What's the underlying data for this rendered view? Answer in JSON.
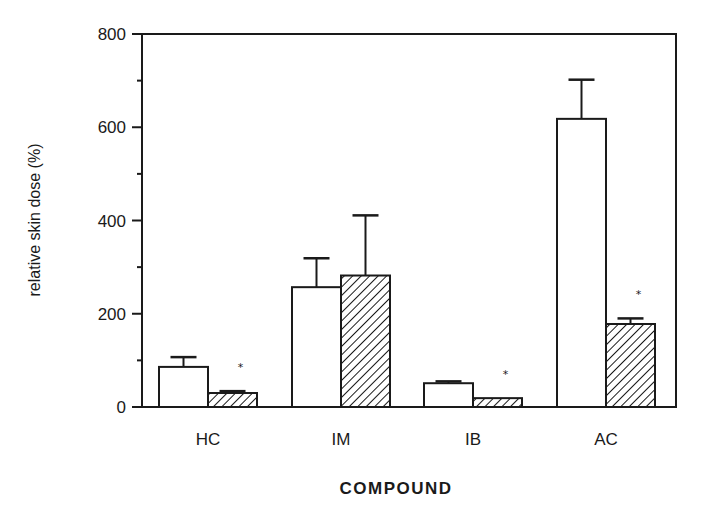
{
  "chart_data": {
    "type": "bar",
    "title": "",
    "xlabel": "COMPOUND",
    "ylabel": "relative skin dose (%)",
    "ylim": [
      0,
      800
    ],
    "yticks": [
      0,
      200,
      400,
      600,
      800
    ],
    "yminor_ticks": [
      100,
      300,
      500,
      700
    ],
    "grid": false,
    "legend": null,
    "categories": [
      "HC",
      "IM",
      "IB",
      "AC"
    ],
    "series": [
      {
        "name": "open (white) bars",
        "style": "white",
        "values": [
          86,
          257,
          51,
          618
        ],
        "error_upper": [
          107,
          319,
          55,
          702
        ]
      },
      {
        "name": "hatched bars",
        "style": "hatched",
        "values": [
          30,
          282,
          19,
          178
        ],
        "error_upper": [
          34,
          411,
          19,
          190
        ]
      }
    ],
    "annotations": [
      {
        "category": "HC",
        "series": 1,
        "text": "*"
      },
      {
        "category": "IB",
        "series": 1,
        "text": "*"
      },
      {
        "category": "AC",
        "series": 1,
        "text": "*"
      }
    ]
  },
  "colors": {
    "ink": "#1a1a1a",
    "background": "#ffffff"
  }
}
